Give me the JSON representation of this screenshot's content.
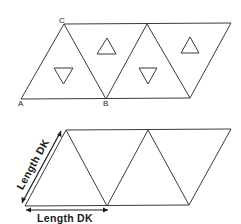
{
  "figure_top": {
    "description": "Net of four equilateral triangles forming a parallelogram, with small triangle symbols in each face",
    "vertex_labels": {
      "A": "A",
      "B": "B",
      "C": "C"
    },
    "face_symbols": [
      "down-triangle",
      "up-triangle",
      "down-triangle",
      "up-triangle"
    ]
  },
  "figure_bottom": {
    "description": "Same net of four equilateral triangles with side-length dimensions",
    "dimension_labels": {
      "diagonal": "Length DK",
      "horizontal": "Length DK"
    }
  },
  "colors": {
    "line": "#3a3a3a",
    "background": "#ffffff"
  }
}
